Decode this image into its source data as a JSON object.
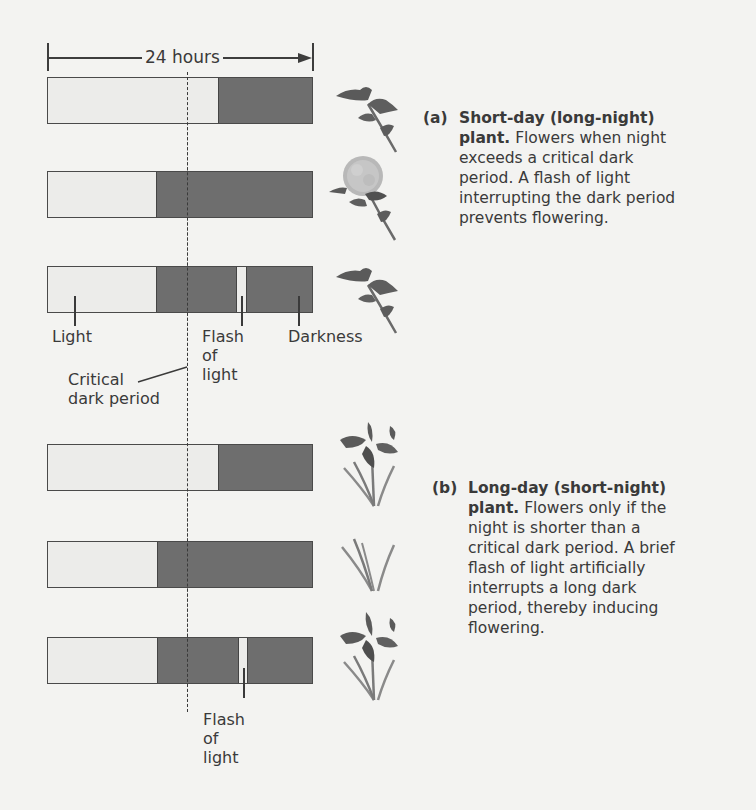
{
  "diagram": {
    "span_label": "24 hours",
    "colors": {
      "light": "#ececea",
      "darkness": "#6e6e6e",
      "outline": "#4a4a4a",
      "background": "#f3f3f1"
    },
    "labels": {
      "light": "Light",
      "flash_of_light_top": [
        "Flash",
        "of",
        "light"
      ],
      "darkness": "Darkness",
      "critical_dark_period": [
        "Critical",
        "dark period"
      ],
      "flash_of_light_bottom": [
        "Flash",
        "of",
        "light"
      ]
    },
    "sections": [
      {
        "id": "a",
        "letter": "(a)",
        "title": "Short-day (long-night) plant.",
        "description": "Flowers when night exceeds a critical dark period. A flash of light interrupting the dark period prevents flowering.",
        "caption_lines": [
          {
            "bold": "Short-day (long-night)",
            "normal": ""
          },
          {
            "bold": "plant.",
            "normal": " Flowers when night"
          },
          {
            "bold": "",
            "normal": "exceeds a critical dark"
          },
          {
            "bold": "",
            "normal": "period. A flash of light"
          },
          {
            "bold": "",
            "normal": "interrupting the dark period"
          },
          {
            "bold": "",
            "normal": "prevents flowering."
          }
        ],
        "rows": [
          {
            "dark_start_pct": 64.3,
            "flash": null,
            "plant": "chrysanthemum-leaves",
            "flowering": false
          },
          {
            "dark_start_pct": 41.0,
            "flash": null,
            "plant": "chrysanthemum-flower",
            "flowering": true
          },
          {
            "dark_start_pct": 41.0,
            "flash": {
              "start_pct": 71.8,
              "width_pct": 3.8
            },
            "plant": "chrysanthemum-leaves",
            "flowering": false
          }
        ]
      },
      {
        "id": "b",
        "letter": "(b)",
        "title": "Long-day (short-night) plant.",
        "description": "Flowers only if the night is shorter than a critical dark period. A brief flash of light artificially interrupts a long dark period, thereby inducing flowering.",
        "caption_lines": [
          {
            "bold": "Long-day (short-night)",
            "normal": ""
          },
          {
            "bold": "plant.",
            "normal": " Flowers only if the"
          },
          {
            "bold": "",
            "normal": "night is shorter than a"
          },
          {
            "bold": "",
            "normal": "critical dark period. A brief"
          },
          {
            "bold": "",
            "normal": "flash of light artificially"
          },
          {
            "bold": "",
            "normal": "interrupts a long dark"
          },
          {
            "bold": "",
            "normal": "period, thereby inducing"
          },
          {
            "bold": "",
            "normal": "flowering."
          }
        ],
        "rows": [
          {
            "dark_start_pct": 64.3,
            "flash": null,
            "plant": "iris-flower",
            "flowering": true
          },
          {
            "dark_start_pct": 41.4,
            "flash": null,
            "plant": "iris-leaves",
            "flowering": false
          },
          {
            "dark_start_pct": 41.4,
            "flash": {
              "start_pct": 71.8,
              "width_pct": 3.6
            },
            "plant": "iris-flower",
            "flowering": true
          }
        ]
      }
    ]
  }
}
